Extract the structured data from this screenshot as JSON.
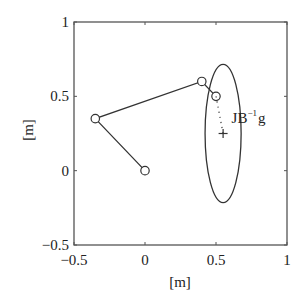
{
  "chart_data": {
    "type": "line",
    "title": "",
    "xlabel": "[m]",
    "ylabel": "[m]",
    "xlim": [
      -0.5,
      1
    ],
    "ylim": [
      -0.5,
      1
    ],
    "grid": false,
    "legend": null,
    "xticks": [
      -0.5,
      0,
      0.5,
      1
    ],
    "yticks": [
      -0.5,
      0,
      0.5,
      1
    ],
    "xtick_labels": [
      "−0.5",
      "0",
      "0.5",
      "1"
    ],
    "ytick_labels": [
      "−0.5",
      "0",
      "0.5",
      "1"
    ],
    "series": [
      {
        "name": "arm-links",
        "style": "solid line with circle markers",
        "color": "#333333",
        "x": [
          0,
          -0.35,
          0.4,
          0.5
        ],
        "y": [
          0,
          0.35,
          0.6,
          0.5
        ]
      },
      {
        "name": "dotted-segment",
        "style": "dotted line",
        "color": "#333333",
        "x": [
          0.5,
          0.55
        ],
        "y": [
          0.5,
          0.25
        ]
      },
      {
        "name": "target-cross",
        "style": "plus marker",
        "color": "#333333",
        "x": [
          0.55
        ],
        "y": [
          0.25
        ]
      }
    ],
    "shapes": [
      {
        "type": "ellipse",
        "center": [
          0.55,
          0.25
        ],
        "half_width": 0.127,
        "half_height": 0.465,
        "color": "#333333"
      }
    ],
    "annotations": [
      {
        "text": "JB",
        "superscript": "−1",
        "suffix": "g",
        "x": 0.61,
        "y": 0.32
      }
    ]
  },
  "figure": {
    "plot_area": {
      "left": 74,
      "top": 22,
      "right": 287,
      "bottom": 245
    },
    "colors": {
      "axes": "#555555",
      "line": "#333333",
      "text": "#222222",
      "background": "#ffffff"
    }
  }
}
